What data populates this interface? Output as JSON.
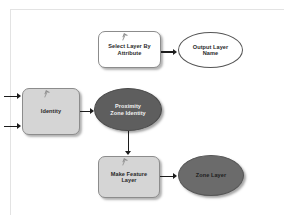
{
  "diagram": {
    "canvas_background": "#ffffff",
    "frame_color": "#e3e3e3",
    "connector_color": "#1c1c1c",
    "nodes": [
      {
        "id": "select-layer-by-attribute",
        "label": "Select Layer By\nAttribute",
        "shape": "rounded-rect",
        "role": "tool",
        "fill": "#ffffff"
      },
      {
        "id": "output-layer-name",
        "label": "Output Layer\nName",
        "shape": "ellipse",
        "role": "variable",
        "fill": "#ffffff"
      },
      {
        "id": "identity",
        "label": "Identity",
        "shape": "rounded-rect",
        "role": "tool",
        "fill": "#d5d5d5"
      },
      {
        "id": "proximity-zone-identity",
        "label": "Proximity\nZone Identity",
        "shape": "ellipse",
        "role": "derived-variable",
        "fill": "#5e5e5e"
      },
      {
        "id": "make-feature-layer",
        "label": "Make Feature\nLayer",
        "shape": "rounded-rect",
        "role": "tool",
        "fill": "#d5d5d5"
      },
      {
        "id": "zone-layer",
        "label": "Zone Layer",
        "shape": "ellipse",
        "role": "derived-variable",
        "fill": "#6b6b6b"
      }
    ],
    "connectors": [
      {
        "id": "select-to-output",
        "from": "select-layer-by-attribute",
        "to": "output-layer-name",
        "direction": "right"
      },
      {
        "id": "input-top-to-identity",
        "from": "offscreen-input-1",
        "to": "identity",
        "direction": "right"
      },
      {
        "id": "input-bottom-to-identity",
        "from": "offscreen-input-2",
        "to": "identity",
        "direction": "right"
      },
      {
        "id": "identity-to-proximity",
        "from": "identity",
        "to": "proximity-zone-identity",
        "direction": "right"
      },
      {
        "id": "proximity-to-make-feature",
        "from": "proximity-zone-identity",
        "to": "make-feature-layer",
        "direction": "down"
      },
      {
        "id": "make-feature-to-zone",
        "from": "make-feature-layer",
        "to": "zone-layer",
        "direction": "right"
      }
    ]
  }
}
